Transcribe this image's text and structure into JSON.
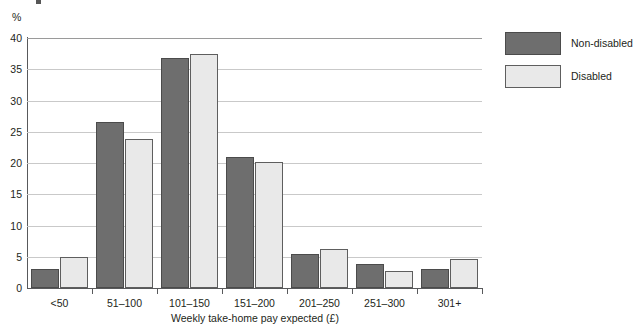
{
  "chart_data": {
    "type": "bar",
    "title": "",
    "subtitle": "",
    "xlabel": "Weekly take-home pay expected (£)",
    "ylabel": "%",
    "ylim": [
      0,
      40
    ],
    "yticks": [
      0,
      5,
      10,
      15,
      20,
      25,
      30,
      35,
      40
    ],
    "ytick_labels": [
      "0",
      "5",
      "10",
      "15",
      "20",
      "25",
      "30",
      "35",
      "40"
    ],
    "grid": true,
    "grid_axis": "y",
    "legend_position": "right",
    "categories": [
      "<50",
      "51–100",
      "101–150",
      "151–200",
      "201–250",
      "251–300",
      "301+"
    ],
    "series": [
      {
        "name": "Non-disabled",
        "color": "#6e6e6e",
        "values": [
          3.0,
          26.5,
          36.8,
          21.0,
          5.4,
          3.8,
          3.0
        ]
      },
      {
        "name": "Disabled",
        "color": "#e9e9e9",
        "values": [
          5.0,
          23.9,
          37.5,
          20.1,
          6.2,
          2.8,
          4.6
        ]
      }
    ]
  },
  "legend": {
    "items": [
      {
        "label": "Non-disabled"
      },
      {
        "label": "Disabled"
      }
    ]
  }
}
